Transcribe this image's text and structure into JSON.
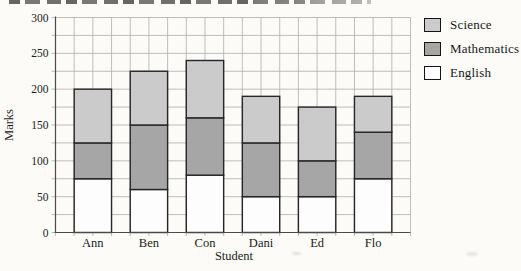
{
  "chart_data": {
    "type": "bar",
    "stacked": true,
    "categories": [
      "Ann",
      "Ben",
      "Con",
      "Dani",
      "Ed",
      "Flo"
    ],
    "series": [
      {
        "name": "English",
        "color": "#fdfdfd",
        "values": [
          75,
          60,
          80,
          50,
          50,
          75
        ]
      },
      {
        "name": "Mathematics",
        "color": "#a6a6a6",
        "values": [
          50,
          90,
          80,
          75,
          50,
          65
        ]
      },
      {
        "name": "Science",
        "color": "#cbcbcb",
        "values": [
          75,
          75,
          80,
          65,
          75,
          50
        ]
      }
    ],
    "totals": [
      200,
      225,
      240,
      190,
      175,
      190
    ],
    "title": "",
    "xlabel": "Student",
    "ylabel": "Marks",
    "ylim": [
      0,
      300
    ],
    "yticks": [
      0,
      50,
      100,
      150,
      200,
      250,
      300
    ],
    "minor_grid_step": 25,
    "grid": true,
    "legend_position": "top-right"
  },
  "legend": {
    "items": [
      {
        "label": "Science",
        "color": "#cbcbcb"
      },
      {
        "label": "Mathematics",
        "color": "#a6a6a6"
      },
      {
        "label": "English",
        "color": "#fdfdfd"
      }
    ]
  }
}
